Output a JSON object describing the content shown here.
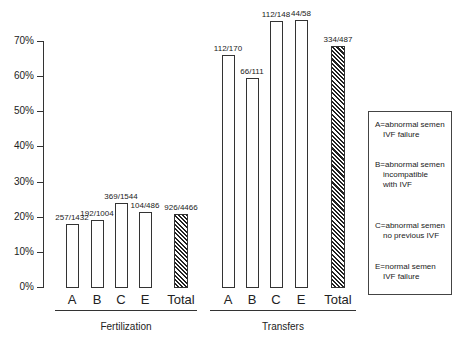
{
  "chart_data": {
    "type": "bar",
    "title": "",
    "ylabel": "",
    "ylim": [
      0,
      70
    ],
    "yticks": [
      "0%",
      "10%",
      "20%",
      "30%",
      "40%",
      "50%",
      "60%",
      "70%"
    ],
    "grid": false,
    "groups": [
      {
        "name": "Fertilization",
        "categories": [
          "A",
          "B",
          "C",
          "E",
          "Total"
        ],
        "labels": [
          "257/1432",
          "192/1004",
          "369/1544",
          "104/486",
          "926/4466"
        ],
        "values": [
          17.9,
          19.1,
          23.9,
          21.4,
          20.7
        ]
      },
      {
        "name": "Transfers",
        "categories": [
          "A",
          "B",
          "C",
          "E",
          "Total"
        ],
        "labels": [
          "112/170",
          "66/111",
          "112/148",
          "44/58",
          "334/487"
        ],
        "values": [
          65.9,
          59.5,
          75.7,
          75.9,
          68.6
        ]
      }
    ],
    "legend": [
      {
        "l1": "A=abnormal semen",
        "l2": "IVF failure",
        "l3": ""
      },
      {
        "l1": "B=abnormal semen",
        "l2": "incompatible",
        "l3": "with IVF"
      },
      {
        "l1": "C=abnormal semen",
        "l2": "no previous IVF",
        "l3": ""
      },
      {
        "l1": "E=normal semen",
        "l2": "IVF failure",
        "l3": ""
      }
    ],
    "legend_position": "right"
  }
}
